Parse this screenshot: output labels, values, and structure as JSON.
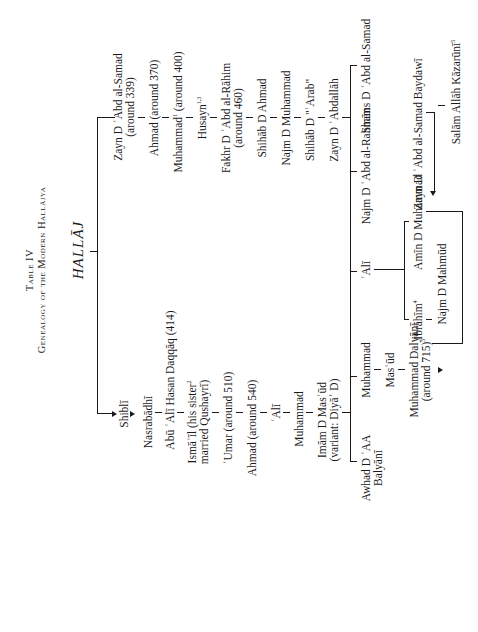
{
  "title": {
    "line1": "Table IV",
    "line2": "Genealogy of the Modern Hallājya"
  },
  "root": "HALLĀJ",
  "left_branch": [
    {
      "name": "Shiblī"
    },
    {
      "name": "Nasrabādhī"
    },
    {
      "name": "Abū ʿAlī Hasan Daqqāq (414)"
    },
    {
      "name": "Ismāʿīl (his sister",
      "sup": "2",
      "line2": "married Qushayrī)"
    },
    {
      "name": "ʿUmar (around 510)"
    },
    {
      "name": "Ahmad (around 540)"
    },
    {
      "name": "ʿAlī"
    },
    {
      "name": "Muhammad"
    },
    {
      "name": "Imām D Masʿūd",
      "line2": "(variant: Diyāʾ D)"
    }
  ],
  "right_branch": [
    {
      "name": "Zayn D ʿAbd al-Samad",
      "line2": "(around 339)"
    },
    {
      "name": "Ahmad (around 370)"
    },
    {
      "name": "Muhammad",
      "sup": "1",
      "suffix": " (around 400)"
    },
    {
      "name": "Husayn",
      "sup": "1,3"
    },
    {
      "name": "Fakhr D ʿAbd al-Rāhim",
      "line2": "(around 460)"
    },
    {
      "name": "Shihāb D Ahmad"
    },
    {
      "name": "Najm D Muhammad"
    },
    {
      "name": "Shihāb D \"ʿArab\""
    },
    {
      "name": "Zayn D ʿAbdallāh"
    }
  ],
  "generation_two": [
    {
      "name": "Awhad D ʿAA",
      "line2": "Balyānī"
    },
    {
      "name": "Muhammad"
    },
    {
      "name": "ʿAlī"
    },
    {
      "name": "Najm D ʿAbd al-Rahmān"
    },
    {
      "name": "Shams D ʿAbd al-Samad"
    }
  ],
  "muhammad_line": [
    {
      "name": "Masʿūd"
    },
    {
      "name": "Muhammad Dalyānī",
      "line2": "(around 715)",
      "sup": "5"
    }
  ],
  "ali_line": [
    {
      "name": "Ibrāhīm",
      "sup": "4"
    },
    {
      "name": "Amīn D Muhammad"
    },
    {
      "name": "Najm D Mahmūd"
    }
  ],
  "shams_line": [
    {
      "name": "Zayn D ʿAbd al-Samad Baydawī"
    },
    {
      "name": "Salām Allāh Kāzarūnī",
      "sup": "5"
    }
  ]
}
